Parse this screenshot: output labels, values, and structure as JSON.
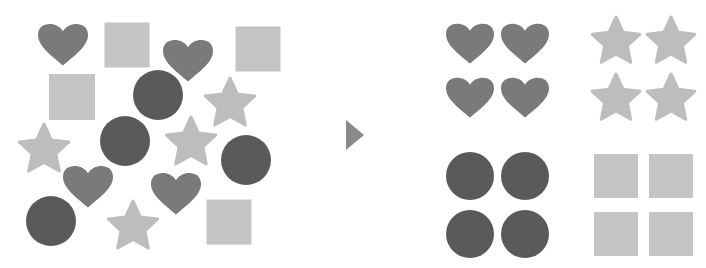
{
  "diagram": {
    "title": "Sorting shapes into groups",
    "colors": {
      "heart": "#7a7a7a",
      "circle": "#5a5a5a",
      "star": "#bdbdbd",
      "square": "#c4c4c4",
      "arrow": "#8a8a8a",
      "background": "#ffffff"
    },
    "left_cluster": {
      "label": "Unsorted shapes",
      "shapes": [
        {
          "type": "heart",
          "x": 63,
          "y": 43,
          "size": 50
        },
        {
          "type": "square",
          "x": 127,
          "y": 45,
          "size": 45
        },
        {
          "type": "heart",
          "x": 188,
          "y": 59,
          "size": 50
        },
        {
          "type": "square",
          "x": 258,
          "y": 49,
          "size": 45
        },
        {
          "type": "square",
          "x": 72,
          "y": 97,
          "size": 46
        },
        {
          "type": "circle",
          "x": 158,
          "y": 95,
          "size": 50
        },
        {
          "type": "star",
          "x": 230,
          "y": 100,
          "size": 52
        },
        {
          "type": "star",
          "x": 44,
          "y": 146,
          "size": 52
        },
        {
          "type": "circle",
          "x": 125,
          "y": 141,
          "size": 50
        },
        {
          "type": "star",
          "x": 191,
          "y": 139,
          "size": 52
        },
        {
          "type": "circle",
          "x": 246,
          "y": 160,
          "size": 50
        },
        {
          "type": "heart",
          "x": 88,
          "y": 185,
          "size": 50
        },
        {
          "type": "heart",
          "x": 176,
          "y": 192,
          "size": 50
        },
        {
          "type": "circle",
          "x": 51,
          "y": 221,
          "size": 50
        },
        {
          "type": "star",
          "x": 133,
          "y": 223,
          "size": 52
        },
        {
          "type": "square",
          "x": 229,
          "y": 222,
          "size": 45
        }
      ]
    },
    "arrow": {
      "type": "triangle-right",
      "x": 346,
      "y": 120,
      "width": 18,
      "height": 30
    },
    "right_groups": [
      {
        "label": "Hearts",
        "type": "heart",
        "shapes": [
          {
            "x": 470,
            "y": 42,
            "size": 48
          },
          {
            "x": 525,
            "y": 42,
            "size": 48
          },
          {
            "x": 470,
            "y": 96,
            "size": 48
          },
          {
            "x": 525,
            "y": 96,
            "size": 48
          }
        ]
      },
      {
        "label": "Stars",
        "type": "star",
        "shapes": [
          {
            "x": 616,
            "y": 38,
            "size": 50
          },
          {
            "x": 671,
            "y": 38,
            "size": 50
          },
          {
            "x": 616,
            "y": 95,
            "size": 50
          },
          {
            "x": 671,
            "y": 95,
            "size": 50
          }
        ]
      },
      {
        "label": "Circles",
        "type": "circle",
        "shapes": [
          {
            "x": 470,
            "y": 176,
            "size": 48
          },
          {
            "x": 525,
            "y": 176,
            "size": 48
          },
          {
            "x": 470,
            "y": 234,
            "size": 48
          },
          {
            "x": 525,
            "y": 234,
            "size": 48
          }
        ]
      },
      {
        "label": "Squares",
        "type": "square",
        "shapes": [
          {
            "x": 616,
            "y": 176,
            "size": 44
          },
          {
            "x": 671,
            "y": 176,
            "size": 44
          },
          {
            "x": 616,
            "y": 234,
            "size": 44
          },
          {
            "x": 671,
            "y": 234,
            "size": 44
          }
        ]
      }
    ]
  }
}
